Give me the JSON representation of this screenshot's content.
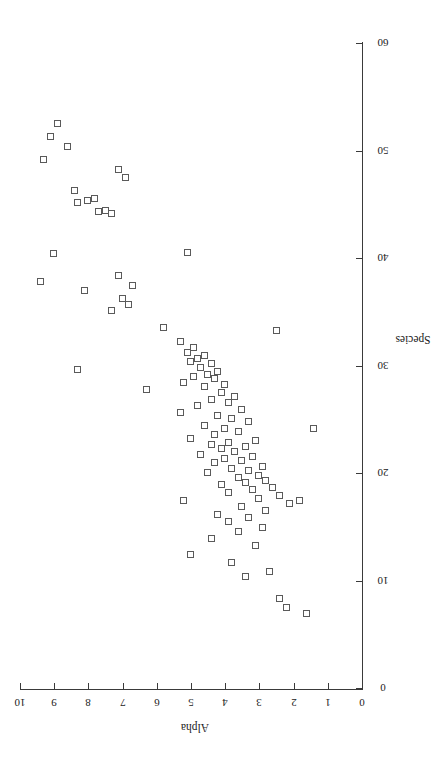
{
  "figure": {
    "background": "#ffffff",
    "marker_color": "#5a5a5a",
    "axis_color": "#3a3a3a",
    "rotation_note": "rotated-90-clockwise"
  },
  "chart_data": {
    "type": "scatter",
    "title": "",
    "xlabel": "Species",
    "ylabel": "Alpha",
    "xlim": [
      0,
      60
    ],
    "ylim": [
      0,
      10
    ],
    "xticks": [
      0,
      10,
      20,
      30,
      40,
      50,
      60
    ],
    "yticks": [
      0,
      1,
      2,
      3,
      4,
      5,
      6,
      7,
      8,
      9,
      10
    ],
    "grid": false,
    "legend": null,
    "marker_style": "open-square",
    "points": [
      {
        "x": 52.5,
        "y": 8.9
      },
      {
        "x": 51.3,
        "y": 9.1
      },
      {
        "x": 50.3,
        "y": 8.6
      },
      {
        "x": 49.1,
        "y": 9.3
      },
      {
        "x": 48.2,
        "y": 7.1
      },
      {
        "x": 47.4,
        "y": 6.9
      },
      {
        "x": 46.2,
        "y": 8.4
      },
      {
        "x": 45.5,
        "y": 7.8
      },
      {
        "x": 45.3,
        "y": 8.0
      },
      {
        "x": 45.1,
        "y": 8.3
      },
      {
        "x": 44.4,
        "y": 7.5
      },
      {
        "x": 44.3,
        "y": 7.7
      },
      {
        "x": 44.1,
        "y": 7.3
      },
      {
        "x": 40.5,
        "y": 5.1
      },
      {
        "x": 40.4,
        "y": 9.0
      },
      {
        "x": 38.3,
        "y": 7.1
      },
      {
        "x": 37.8,
        "y": 9.4
      },
      {
        "x": 37.4,
        "y": 6.7
      },
      {
        "x": 36.9,
        "y": 8.1
      },
      {
        "x": 36.2,
        "y": 7.0
      },
      {
        "x": 35.6,
        "y": 6.8
      },
      {
        "x": 35.1,
        "y": 7.3
      },
      {
        "x": 33.5,
        "y": 5.8
      },
      {
        "x": 33.2,
        "y": 2.5
      },
      {
        "x": 32.2,
        "y": 5.3
      },
      {
        "x": 31.6,
        "y": 4.9
      },
      {
        "x": 31.2,
        "y": 5.1
      },
      {
        "x": 30.9,
        "y": 4.6
      },
      {
        "x": 30.6,
        "y": 4.8
      },
      {
        "x": 30.3,
        "y": 5.0
      },
      {
        "x": 30.1,
        "y": 4.4
      },
      {
        "x": 29.8,
        "y": 4.7
      },
      {
        "x": 29.6,
        "y": 8.3
      },
      {
        "x": 29.4,
        "y": 4.2
      },
      {
        "x": 29.1,
        "y": 4.5
      },
      {
        "x": 28.9,
        "y": 4.9
      },
      {
        "x": 28.7,
        "y": 4.3
      },
      {
        "x": 28.4,
        "y": 5.2
      },
      {
        "x": 28.2,
        "y": 4.0
      },
      {
        "x": 28.0,
        "y": 4.6
      },
      {
        "x": 27.7,
        "y": 6.3
      },
      {
        "x": 27.4,
        "y": 4.1
      },
      {
        "x": 27.1,
        "y": 3.7
      },
      {
        "x": 26.8,
        "y": 4.4
      },
      {
        "x": 26.5,
        "y": 3.9
      },
      {
        "x": 26.2,
        "y": 4.8
      },
      {
        "x": 25.9,
        "y": 3.5
      },
      {
        "x": 25.6,
        "y": 5.3
      },
      {
        "x": 25.3,
        "y": 4.2
      },
      {
        "x": 25.0,
        "y": 3.8
      },
      {
        "x": 24.7,
        "y": 3.3
      },
      {
        "x": 24.4,
        "y": 4.6
      },
      {
        "x": 24.1,
        "y": 4.0
      },
      {
        "x": 23.8,
        "y": 3.6
      },
      {
        "x": 23.5,
        "y": 4.3
      },
      {
        "x": 23.2,
        "y": 5.0
      },
      {
        "x": 23.0,
        "y": 3.1
      },
      {
        "x": 22.8,
        "y": 3.9
      },
      {
        "x": 22.6,
        "y": 4.4
      },
      {
        "x": 22.4,
        "y": 3.4
      },
      {
        "x": 22.2,
        "y": 4.1
      },
      {
        "x": 22.0,
        "y": 3.7
      },
      {
        "x": 21.7,
        "y": 4.7
      },
      {
        "x": 21.5,
        "y": 3.2
      },
      {
        "x": 21.3,
        "y": 4.0
      },
      {
        "x": 21.1,
        "y": 3.5
      },
      {
        "x": 20.9,
        "y": 4.3
      },
      {
        "x": 20.6,
        "y": 2.9
      },
      {
        "x": 20.4,
        "y": 3.8
      },
      {
        "x": 20.2,
        "y": 3.3
      },
      {
        "x": 20.0,
        "y": 4.5
      },
      {
        "x": 19.7,
        "y": 3.0
      },
      {
        "x": 19.5,
        "y": 3.6
      },
      {
        "x": 19.3,
        "y": 2.8
      },
      {
        "x": 19.1,
        "y": 3.4
      },
      {
        "x": 18.9,
        "y": 4.1
      },
      {
        "x": 18.6,
        "y": 2.6
      },
      {
        "x": 18.4,
        "y": 3.2
      },
      {
        "x": 18.1,
        "y": 3.9
      },
      {
        "x": 17.9,
        "y": 2.4
      },
      {
        "x": 17.6,
        "y": 3.0
      },
      {
        "x": 17.4,
        "y": 5.2
      },
      {
        "x": 17.1,
        "y": 2.1
      },
      {
        "x": 16.8,
        "y": 3.5
      },
      {
        "x": 16.5,
        "y": 2.8
      },
      {
        "x": 16.1,
        "y": 4.2
      },
      {
        "x": 15.8,
        "y": 3.3
      },
      {
        "x": 15.4,
        "y": 3.9
      },
      {
        "x": 14.9,
        "y": 2.9
      },
      {
        "x": 14.5,
        "y": 3.6
      },
      {
        "x": 13.9,
        "y": 4.4
      },
      {
        "x": 13.2,
        "y": 3.1
      },
      {
        "x": 12.4,
        "y": 5.0
      },
      {
        "x": 11.6,
        "y": 3.8
      },
      {
        "x": 10.8,
        "y": 2.7
      },
      {
        "x": 10.3,
        "y": 3.4
      },
      {
        "x": 24.1,
        "y": 1.4
      },
      {
        "x": 17.4,
        "y": 1.8
      },
      {
        "x": 8.3,
        "y": 2.4
      },
      {
        "x": 7.4,
        "y": 2.2
      },
      {
        "x": 6.9,
        "y": 1.6
      }
    ]
  },
  "axes": {
    "species": {
      "title": "Species",
      "ticks": [
        "0",
        "10",
        "20",
        "30",
        "40",
        "50",
        "60"
      ]
    },
    "alpha": {
      "title": "Alpha",
      "ticks": [
        "0",
        "1",
        "2",
        "3",
        "4",
        "5",
        "6",
        "7",
        "8",
        "9",
        "10"
      ]
    }
  }
}
